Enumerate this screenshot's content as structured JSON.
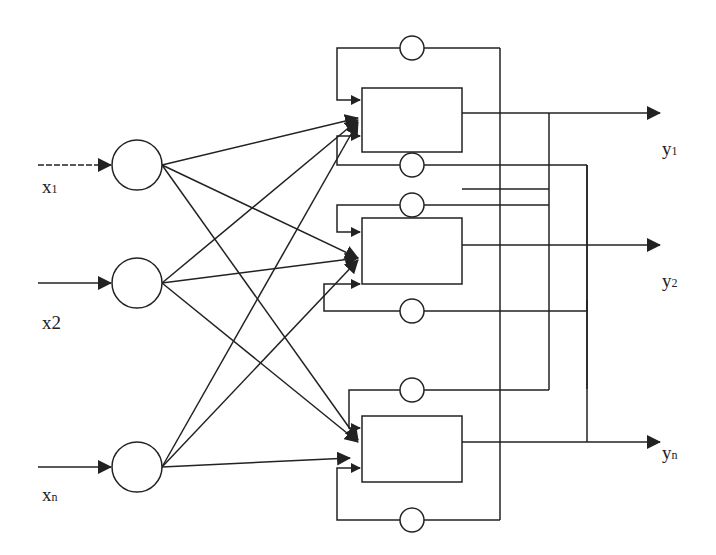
{
  "diagram": {
    "type": "recurrent neural network",
    "inputs": [
      {
        "label": "x",
        "sub": "1"
      },
      {
        "label": "x2",
        "sub": ""
      },
      {
        "label": "x",
        "sub": "n"
      }
    ],
    "outputs": [
      {
        "label": "y",
        "sub": "1"
      },
      {
        "label": "y",
        "sub": "2"
      },
      {
        "label": "y",
        "sub": "n"
      }
    ],
    "colors": {
      "stroke": "#222222",
      "background": "#ffffff"
    }
  }
}
